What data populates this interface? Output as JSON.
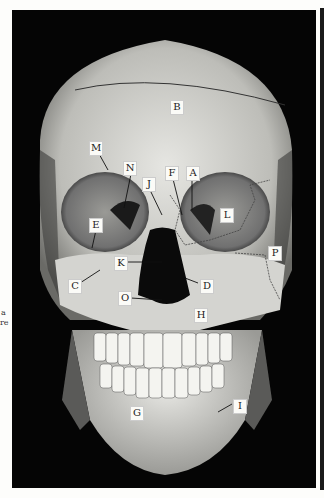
{
  "figure": {
    "labels": [
      {
        "id": "A",
        "text": "A",
        "x": 186,
        "y": 166
      },
      {
        "id": "B",
        "text": "B",
        "x": 170,
        "y": 100
      },
      {
        "id": "C",
        "text": "C",
        "x": 68,
        "y": 279
      },
      {
        "id": "D",
        "text": "D",
        "x": 200,
        "y": 279
      },
      {
        "id": "E",
        "text": "E",
        "x": 89,
        "y": 218
      },
      {
        "id": "F",
        "text": "F",
        "x": 165,
        "y": 166
      },
      {
        "id": "G",
        "text": "G",
        "x": 130,
        "y": 406
      },
      {
        "id": "H",
        "text": "H",
        "x": 194,
        "y": 308
      },
      {
        "id": "I",
        "text": "I",
        "x": 233,
        "y": 399
      },
      {
        "id": "J",
        "text": "J",
        "x": 142,
        "y": 177
      },
      {
        "id": "K",
        "text": "K",
        "x": 114,
        "y": 256
      },
      {
        "id": "L",
        "text": "L",
        "x": 220,
        "y": 208
      },
      {
        "id": "M",
        "text": "M",
        "x": 89,
        "y": 141
      },
      {
        "id": "N",
        "text": "N",
        "x": 123,
        "y": 161
      },
      {
        "id": "O",
        "text": "O",
        "x": 118,
        "y": 291
      },
      {
        "id": "P",
        "text": "P",
        "x": 268,
        "y": 246
      }
    ]
  },
  "margin_text": {
    "line1": "a",
    "line2": "re"
  }
}
